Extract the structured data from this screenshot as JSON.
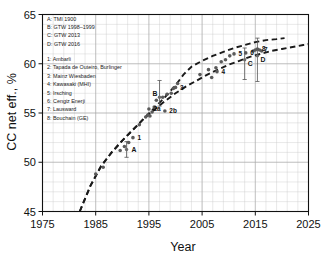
{
  "chart_data": {
    "type": "scatter",
    "title": "",
    "xlabel": "Year",
    "ylabel": "CC net eff., %",
    "xlim": [
      1975,
      2025
    ],
    "ylim": [
      45,
      65
    ],
    "xticks": [
      1975,
      1985,
      1995,
      2005,
      2015,
      2025
    ],
    "yticks": [
      45,
      50,
      55,
      60,
      65
    ],
    "xtick_labels": [
      "1975",
      "1985",
      "1995",
      "2005",
      "2015",
      "2025"
    ],
    "ytick_labels": [
      "45",
      "50",
      "55",
      "60",
      "65"
    ],
    "x_minor_step": 2,
    "y_minor_step": 1,
    "grid": true,
    "grid_color": "#c8c8c8",
    "legend_position": "upper-left-inside",
    "marker_color": "#5a5a5a",
    "line_color": "#1a1a1a",
    "points": [
      {
        "x": 1985.0,
        "y": 48.8
      },
      {
        "x": 1986.4,
        "y": 49.5
      },
      {
        "x": 1989.6,
        "y": 51.2
      },
      {
        "x": 1990.4,
        "y": 51.6
      },
      {
        "x": 1991.2,
        "y": 52.0
      },
      {
        "x": 1992.0,
        "y": 52.5,
        "label": "1"
      },
      {
        "x": 1993.2,
        "y": 53.8
      },
      {
        "x": 1994.4,
        "y": 54.6
      },
      {
        "x": 1994.8,
        "y": 54.8
      },
      {
        "x": 1995.2,
        "y": 54.7
      },
      {
        "x": 1995.0,
        "y": 55.4,
        "label": "2a"
      },
      {
        "x": 1995.6,
        "y": 55.1
      },
      {
        "x": 1996.0,
        "y": 55.6
      },
      {
        "x": 1996.4,
        "y": 56.3
      },
      {
        "x": 1997.6,
        "y": 56.6
      },
      {
        "x": 1998.4,
        "y": 56.9
      },
      {
        "x": 1998.0,
        "y": 55.2,
        "label": "2b"
      },
      {
        "x": 1999.2,
        "y": 57.0
      },
      {
        "x": 1999.6,
        "y": 57.5
      },
      {
        "x": 2000.0,
        "y": 57.6,
        "label": "3"
      },
      {
        "x": 2000.4,
        "y": 58.0
      },
      {
        "x": 2004.6,
        "y": 58.9
      },
      {
        "x": 2006.2,
        "y": 59.4
      },
      {
        "x": 2006.8,
        "y": 58.6
      },
      {
        "x": 2007.6,
        "y": 59.6
      },
      {
        "x": 2007.8,
        "y": 59.2,
        "label": "4"
      },
      {
        "x": 2008.6,
        "y": 60.2
      },
      {
        "x": 2009.4,
        "y": 60.4
      },
      {
        "x": 2010.2,
        "y": 60.8
      },
      {
        "x": 2011.0,
        "y": 61.0,
        "label": "5"
      },
      {
        "x": 2013.2,
        "y": 61.1,
        "label": "6"
      },
      {
        "x": 2014.6,
        "y": 61.3
      },
      {
        "x": 2015.0,
        "y": 61.4
      },
      {
        "x": 2015.4,
        "y": 61.5,
        "label": "8"
      },
      {
        "x": 2015.8,
        "y": 61.4,
        "label": "7"
      },
      {
        "x": 2016.2,
        "y": 61.3
      }
    ],
    "error_bars": [
      {
        "label": "A",
        "x": 1990.8,
        "y": 51.3,
        "ylow": 50.5,
        "yhigh": 52.1,
        "label_dx": 5,
        "label_dy": 3
      },
      {
        "label": "B",
        "x": 1997.0,
        "y": 56.6,
        "ylow": 55.7,
        "yhigh": 58.3,
        "label_dx": -7,
        "label_dy": -1
      },
      {
        "label": "C",
        "x": 2013.0,
        "y": 60.4,
        "ylow": 58.4,
        "yhigh": 61.6,
        "label_dx": 3,
        "label_dy": 6
      },
      {
        "label": "D",
        "x": 2015.4,
        "y": 60.8,
        "ylow": 58.2,
        "yhigh": 62.6,
        "label_dx": 3,
        "label_dy": 6
      }
    ],
    "curves": [
      {
        "name": "upper-trend",
        "style": "dashed",
        "points": [
          [
            1982.0,
            45.0
          ],
          [
            1984.0,
            47.6
          ],
          [
            1986.0,
            49.6
          ],
          [
            1988.0,
            51.0
          ],
          [
            1990.0,
            52.2
          ],
          [
            1992.0,
            53.3
          ],
          [
            1994.0,
            54.4
          ],
          [
            1996.0,
            55.5
          ],
          [
            1998.0,
            56.6
          ],
          [
            2000.0,
            57.8
          ],
          [
            2001.5,
            58.9
          ],
          [
            2003.0,
            59.7
          ],
          [
            2005.0,
            60.3
          ],
          [
            2007.0,
            60.8
          ],
          [
            2009.0,
            61.2
          ],
          [
            2011.0,
            61.6
          ],
          [
            2013.0,
            61.9
          ],
          [
            2015.0,
            62.2
          ],
          [
            2017.0,
            62.4
          ],
          [
            2019.0,
            62.5
          ],
          [
            2020.5,
            62.6
          ]
        ]
      },
      {
        "name": "lower-trend",
        "style": "dashed",
        "points": [
          [
            1982.0,
            45.0
          ],
          [
            1984.0,
            47.6
          ],
          [
            1986.0,
            49.6
          ],
          [
            1988.0,
            51.0
          ],
          [
            1990.0,
            52.2
          ],
          [
            1992.0,
            53.3
          ],
          [
            1994.0,
            54.4
          ],
          [
            1996.0,
            55.3
          ],
          [
            1998.0,
            56.2
          ],
          [
            2000.0,
            57.0
          ],
          [
            2002.0,
            57.7
          ],
          [
            2004.0,
            58.3
          ],
          [
            2006.0,
            58.9
          ],
          [
            2008.0,
            59.4
          ],
          [
            2010.0,
            59.9
          ],
          [
            2012.0,
            60.3
          ],
          [
            2014.0,
            60.7
          ],
          [
            2016.0,
            61.0
          ],
          [
            2018.0,
            61.3
          ],
          [
            2020.0,
            61.5
          ],
          [
            2022.0,
            61.7
          ],
          [
            2024.0,
            61.9
          ],
          [
            2025.0,
            62.0
          ]
        ]
      }
    ]
  },
  "legend": {
    "sources": [
      "A: TMI 1900",
      "B: GTW 1998–1999",
      "C: GTW 2013",
      "D: GTW 2016"
    ],
    "plants": [
      "1: Ambarli",
      "2: Tapada de Outeiro, Burlinger",
      "3: Mainz Wiesbaden",
      "4: Kawasaki (MHI)",
      "5: Irsching",
      "6: Cengiz Enerji",
      "7: Lausward",
      "8: Bouchain (GE)"
    ]
  }
}
